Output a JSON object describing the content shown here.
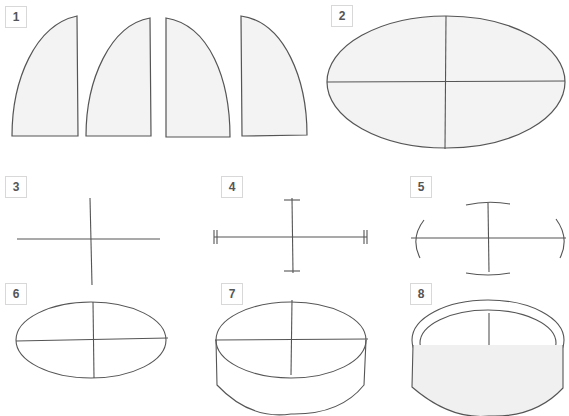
{
  "steps": [
    {
      "number": "1",
      "description": "Four quarter-dome segments"
    },
    {
      "number": "2",
      "description": "Ellipse divided into quarters"
    },
    {
      "number": "3",
      "description": "Cross of axes"
    },
    {
      "number": "4",
      "description": "Axes with tick marks"
    },
    {
      "number": "5",
      "description": "Axes with arc guides"
    },
    {
      "number": "6",
      "description": "Sketched ellipse with axes"
    },
    {
      "number": "7",
      "description": "Cylinder body added"
    },
    {
      "number": "8",
      "description": "Finished bowl with rim"
    }
  ],
  "colors": {
    "line": "#444444",
    "fill": "#f2f2f2",
    "label_border": "#d8d8d8",
    "label_text": "#555555"
  }
}
